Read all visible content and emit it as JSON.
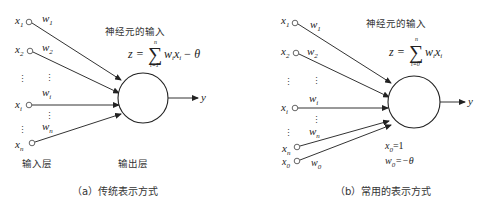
{
  "panel_a": {
    "caption": "（a）传统表示方式",
    "neuron_input_label": "神经元的输入",
    "formula": {
      "lhs": "z =",
      "sum_top": "n",
      "sum_bottom": "i=1",
      "body": "w",
      "body_sub": "i",
      "x": "x",
      "x_sub": "i",
      "tail": "− θ"
    },
    "input_layer_label": "输入层",
    "output_layer_label": "输出层",
    "output_label": "y",
    "inputs": [
      {
        "x": "x",
        "sub": "1",
        "w": "w",
        "wsub": "1"
      },
      {
        "x": "x",
        "sub": "2",
        "w": "w",
        "wsub": "2"
      },
      {
        "x": "x",
        "sub": "i",
        "w": "w",
        "wsub": "i"
      },
      {
        "x": "x",
        "sub": "n",
        "w": "w",
        "wsub": "n"
      }
    ],
    "ellipsis": "⋮"
  },
  "panel_b": {
    "caption": "（b）常用的表示方式",
    "neuron_input_label": "神经元的输入",
    "formula": {
      "lhs": "z =",
      "sum_top": "n",
      "sum_bottom": "i=0",
      "body": "w",
      "body_sub": "i",
      "x": "x",
      "x_sub": "i"
    },
    "output_label": "y",
    "inputs": [
      {
        "x": "x",
        "sub": "1",
        "w": "w",
        "wsub": "1"
      },
      {
        "x": "x",
        "sub": "2",
        "w": "w",
        "wsub": "2"
      },
      {
        "x": "x",
        "sub": "i",
        "w": "w",
        "wsub": "i"
      },
      {
        "x": "x",
        "sub": "n",
        "w": "w",
        "wsub": "n"
      },
      {
        "x": "x",
        "sub": "0",
        "w": "w",
        "wsub": "0"
      }
    ],
    "bias_note_1": {
      "v": "x",
      "sub": "0",
      "rhs": "=1"
    },
    "bias_note_2": {
      "v": "w",
      "sub": "0",
      "rhs": "=−θ"
    },
    "ellipsis": "⋮"
  }
}
